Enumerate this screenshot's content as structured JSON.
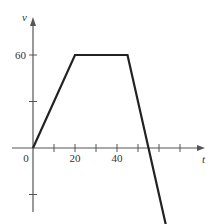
{
  "chart_data": {
    "type": "line",
    "title": "",
    "xlabel": "t",
    "ylabel": "v",
    "x": [
      0,
      20,
      45,
      55,
      70
    ],
    "series": [
      {
        "name": "v(t)",
        "values": [
          0,
          60,
          60,
          0,
          -90
        ]
      }
    ],
    "x_tick_labels": [
      "0",
      "20",
      "40"
    ],
    "x_ticks": [
      10,
      20,
      30,
      40,
      50,
      60,
      70
    ],
    "y_tick_labels": [
      "60"
    ],
    "y_ticks": [
      -30,
      30,
      60
    ],
    "xlim": [
      -10,
      85
    ],
    "ylim": [
      -100,
      80
    ],
    "grid": false,
    "legend": "none",
    "line_color": "#222222",
    "axis_color": "#555555"
  }
}
